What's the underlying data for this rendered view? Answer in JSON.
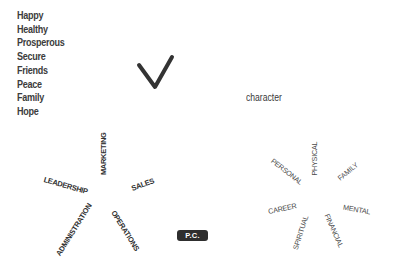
{
  "values_list": {
    "items": [
      "Happy",
      "Healthy",
      "Prosperous",
      "Secure",
      "Friends",
      "Peace",
      "Family",
      "Hope"
    ]
  },
  "checkmark": {
    "icon": "checkmark-icon",
    "color": "#333333"
  },
  "character_label": "character",
  "business_wheel": {
    "words": [
      "MARKETING",
      "LEADERSHIP",
      "SALES",
      "ADMINISTRATION",
      "OPERATIONS"
    ]
  },
  "badge": {
    "label": "P.C.",
    "background": "#2e2e2e",
    "text_color": "#ffffff"
  },
  "life_wheel": {
    "words": [
      "PHYSICAL",
      "PERSONAL",
      "FAMILY",
      "CAREER",
      "MENTAL",
      "SPIRITUAL",
      "FINANCIAL"
    ]
  }
}
